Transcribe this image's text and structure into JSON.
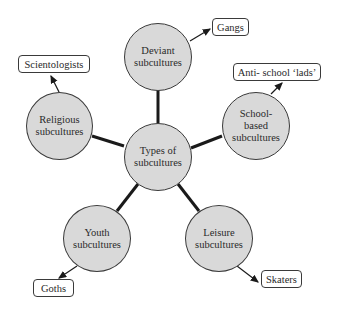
{
  "center": {
    "label": "Types of\nsubcultures"
  },
  "nodes": [
    {
      "id": "deviant",
      "label": "Deviant\nsubcultures",
      "example": "Gangs"
    },
    {
      "id": "school",
      "label": "School-\nbased\nsubcultures",
      "example": "Anti- school ‘lads’"
    },
    {
      "id": "leisure",
      "label": "Leisure\nsubcultures",
      "example": "Skaters"
    },
    {
      "id": "youth",
      "label": "Youth\nsubcultures",
      "example": "Goths"
    },
    {
      "id": "religious",
      "label": "Religious\nsubcultures",
      "example": "Scientologists"
    }
  ],
  "colors": {
    "node_fill": "#d9d9d9",
    "stroke": "#1a1a1a"
  }
}
